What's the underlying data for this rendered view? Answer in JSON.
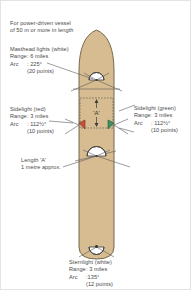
{
  "figure": {
    "title_lines": [
      "For power-driven vessel",
      "of 50 m or more in length"
    ],
    "hull_color": "#d6bc90",
    "hull_outline_color": "#6a5a3e",
    "light_white_color": "#ffffff",
    "light_red_color": "#c8503c",
    "light_green_color": "#3f8f63",
    "arc_line_color": "#5a5a5a",
    "dimension_label": "'A'"
  },
  "masthead": {
    "name": "Masthead lights (white)",
    "range_key": "Range",
    "range_value": ": 6 miles",
    "arc_key": "Arc",
    "arc_value": ": 225°",
    "points": "(20 points)"
  },
  "sidelight_red": {
    "name": "Sidelight (red)",
    "range_key": "Range",
    "range_value": ": 3 miles",
    "arc_key": "Arc",
    "arc_value": ": 112½°",
    "points": "(10 points)"
  },
  "sidelight_green": {
    "name": "Sidelight (green)",
    "range_key": "Range",
    "range_value": ": 3 miles",
    "arc_key": "Arc",
    "arc_value": ": 112½°",
    "points": "(10 points)"
  },
  "sternlight": {
    "name": "Sternlight (white)",
    "range_key": "Range",
    "range_value": ": 3 miles",
    "arc_key": "Arc",
    "arc_value": ":135°",
    "points": "(12 points)"
  },
  "length_a": {
    "line1": "Length 'A'",
    "line2": "1 metre approx."
  }
}
